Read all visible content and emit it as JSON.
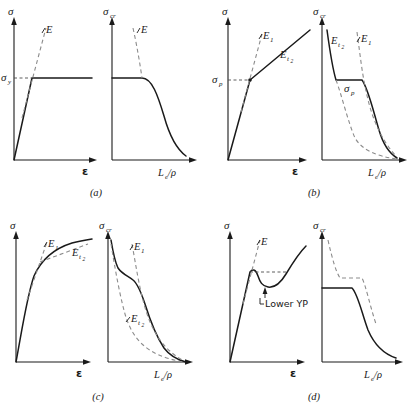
{
  "figure": {
    "background_color": "#ffffff",
    "curve_color": "#1a1a1a",
    "dashed_color": "#8c8c8c"
  },
  "axis_labels": {
    "stress": "σ",
    "stress_critical_base": "σ",
    "stress_critical_sub": "cr",
    "strain": "ε",
    "slenderness_base": "L",
    "slenderness_sub": "e",
    "slenderness_denom": "/ρ"
  },
  "panels": [
    {
      "id": "a",
      "label": "(a)",
      "left_plot": {
        "yaxis": "σ",
        "xaxis": "ε",
        "yield_base": "σ",
        "yield_sub": "y",
        "modulus": "E",
        "description": "elastic perfectly plastic"
      },
      "right_plot": {
        "yaxis_base": "σ",
        "yaxis_sub": "cr",
        "xaxis": "L_e/ρ",
        "modulus": "E",
        "description": "plateau then Euler hyperbola"
      }
    },
    {
      "id": "b",
      "label": "(b)",
      "left_plot": {
        "yaxis": "σ",
        "xaxis": "ε",
        "prop_limit_base": "σ",
        "prop_limit_sub": "p",
        "modulus1_base": "E",
        "modulus1_sub": "1",
        "modulus2_base": "E",
        "modulus2_sub": "t",
        "modulus2_sub2": "2",
        "description": "bilinear elastic plastic"
      },
      "right_plot": {
        "yaxis_base": "σ",
        "yaxis_sub": "cr",
        "xaxis": "L_e/ρ",
        "prop_limit_base": "σ",
        "prop_limit_sub": "p",
        "modulus1_base": "E",
        "modulus1_sub": "1",
        "modulus2_base": "E",
        "modulus2_sub": "t",
        "modulus2_sub2": "2",
        "description": "two Euler curves with plateau"
      }
    },
    {
      "id": "c",
      "label": "(c)",
      "left_plot": {
        "yaxis": "σ",
        "xaxis": "ε",
        "modulus1_base": "E",
        "modulus1_sub": "1",
        "modulus2_base": "E",
        "modulus2_sub": "t",
        "modulus2_sub2": "2",
        "description": "gradual yielding curve"
      },
      "right_plot": {
        "yaxis_base": "σ",
        "yaxis_sub": "cr",
        "xaxis": "L_e/ρ",
        "modulus1_base": "E",
        "modulus1_sub": "1",
        "modulus2_base": "E",
        "modulus2_sub": "t",
        "modulus2_sub2": "2",
        "description": "S shaped transition column curve"
      }
    },
    {
      "id": "d",
      "label": "(d)",
      "left_plot": {
        "yaxis": "σ",
        "xaxis": "ε",
        "modulus": "E",
        "annotation": "Lower YP",
        "description": "upper and lower yield point with strain hardening"
      },
      "right_plot": {
        "yaxis_base": "σ",
        "yaxis_sub": "cr",
        "xaxis": "L_e/ρ",
        "description": "lower yield plateau with dashed upper yield plateau"
      }
    }
  ]
}
